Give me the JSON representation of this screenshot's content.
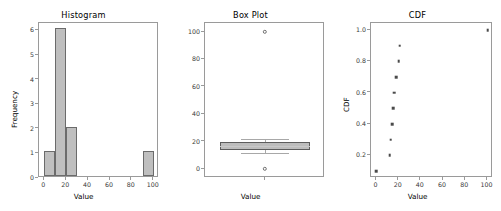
{
  "figure": {
    "width": 501,
    "height": 211,
    "background": "#ffffff",
    "bar_face_color": "#bfbfbf",
    "bar_edge_color": "#6b6b6b",
    "marker_color": "#4a4a4a",
    "axis_color": "#9a9a9a"
  },
  "chart_data": [
    {
      "type": "bar",
      "title": "Histogram",
      "xlabel": "Value",
      "ylabel": "Frequency",
      "xlim": [
        -4.9,
        104.9
      ],
      "ylim": [
        0,
        6.3
      ],
      "xticks": [
        0,
        20,
        40,
        60,
        80,
        100
      ],
      "xticklabels": [
        "0",
        "20",
        "40",
        "60",
        "80",
        "100"
      ],
      "yticks": [
        0,
        1,
        2,
        3,
        4,
        5,
        6
      ],
      "yticklabels": [
        "0",
        "1",
        "2",
        "3",
        "4",
        "5",
        "6"
      ],
      "grid": false,
      "bin_edges": [
        0,
        10,
        20,
        30,
        40,
        50,
        60,
        70,
        80,
        90,
        100
      ],
      "categories": [
        "0-10",
        "10-20",
        "20-30",
        "30-40",
        "40-50",
        "50-60",
        "60-70",
        "70-80",
        "80-90",
        "90-100"
      ],
      "values": [
        1,
        6,
        2,
        0,
        0,
        0,
        0,
        0,
        0,
        1
      ]
    },
    {
      "type": "box",
      "title": "Box Plot",
      "xlabel": "Value",
      "ylabel": "",
      "ylim": [
        -6.5,
        106.5
      ],
      "yticks": [
        0,
        20,
        40,
        60,
        80,
        100
      ],
      "yticklabels": [
        "0",
        "20",
        "40",
        "60",
        "80",
        "100"
      ],
      "xticks": [
        1
      ],
      "xticklabels": [
        "Value"
      ],
      "grid": false,
      "box": {
        "whisker_low": 12,
        "q1": 14,
        "median": 16.5,
        "q3": 20,
        "whisker_high": 22,
        "outliers": [
          0,
          100
        ]
      }
    },
    {
      "type": "scatter",
      "title": "CDF",
      "xlabel": "Value",
      "ylabel": "CDF",
      "xlim": [
        -4.9,
        104.9
      ],
      "ylim": [
        0.055,
        1.045
      ],
      "xticks": [
        0,
        20,
        40,
        60,
        80,
        100
      ],
      "xticklabels": [
        "0",
        "20",
        "40",
        "60",
        "80",
        "100"
      ],
      "yticks": [
        0.2,
        0.4,
        0.6,
        0.8,
        1.0
      ],
      "yticklabels": [
        "0.2",
        "0.4",
        "0.6",
        "0.8",
        "1.0"
      ],
      "grid": false,
      "x": [
        0,
        12,
        13,
        14,
        15,
        16,
        18,
        20,
        21,
        100
      ],
      "y": [
        0.1,
        0.2,
        0.3,
        0.4,
        0.5,
        0.6,
        0.7,
        0.8,
        0.9,
        1.0
      ]
    }
  ]
}
